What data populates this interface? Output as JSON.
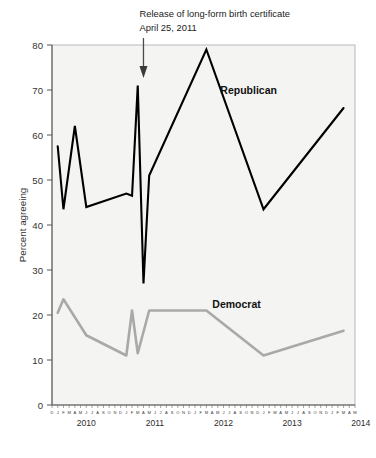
{
  "chart_data": {
    "type": "line",
    "title": "",
    "xlabel": "",
    "ylabel": "Percent agreeing",
    "ylim": [
      0,
      80
    ],
    "yticks": [
      0,
      10,
      20,
      30,
      40,
      50,
      60,
      70,
      80
    ],
    "grid": false,
    "legend_position": "inline-annotation",
    "xlim_months": [
      "2009-12",
      "2014-05"
    ],
    "month_tick_labels": [
      "J",
      "F",
      "M",
      "A",
      "M",
      "J",
      "J",
      "A",
      "S",
      "O",
      "N",
      "D"
    ],
    "year_tick_labels": [
      "2010",
      "2011",
      "2012",
      "2013",
      "2014"
    ],
    "annotations": [
      {
        "name": "release-annotation",
        "line1": "Release of long-form birth certificate",
        "line2": "April 25, 2011",
        "points_to_month": "2011-04",
        "arrow": true
      }
    ],
    "series": [
      {
        "name": "Republican",
        "color": "#000000",
        "label_x_month": "2012-03",
        "label_y_value": 70,
        "points": [
          {
            "month": "2010-01",
            "value": 57.5
          },
          {
            "month": "2010-02",
            "value": 43.5
          },
          {
            "month": "2010-04",
            "value": 62.0
          },
          {
            "month": "2010-06",
            "value": 44.0
          },
          {
            "month": "2011-01",
            "value": 47.0
          },
          {
            "month": "2011-02",
            "value": 46.5
          },
          {
            "month": "2011-03",
            "value": 71.0
          },
          {
            "month": "2011-04",
            "value": 27.0
          },
          {
            "month": "2011-05",
            "value": 51.0
          },
          {
            "month": "2012-03",
            "value": 79.0
          },
          {
            "month": "2013-01",
            "value": 43.5
          },
          {
            "month": "2014-03",
            "value": 66.0
          }
        ]
      },
      {
        "name": "Democrat",
        "color": "#a9a9a9",
        "label_x_month": "2012-03",
        "label_y_value": 22.5,
        "points": [
          {
            "month": "2010-01",
            "value": 20.5
          },
          {
            "month": "2010-02",
            "value": 23.5
          },
          {
            "month": "2010-06",
            "value": 15.5
          },
          {
            "month": "2011-01",
            "value": 11.0
          },
          {
            "month": "2011-02",
            "value": 21.0
          },
          {
            "month": "2011-03",
            "value": 11.5
          },
          {
            "month": "2011-05",
            "value": 21.0
          },
          {
            "month": "2012-03",
            "value": 21.0
          },
          {
            "month": "2013-01",
            "value": 11.0
          },
          {
            "month": "2014-03",
            "value": 16.5
          }
        ]
      }
    ]
  },
  "axes": {
    "y_axis_title": "Percent agreeing",
    "y_tick_0": "0",
    "y_tick_10": "10",
    "y_tick_20": "20",
    "y_tick_30": "30",
    "y_tick_40": "40",
    "y_tick_50": "50",
    "y_tick_60": "60",
    "y_tick_70": "70",
    "y_tick_80": "80"
  },
  "labels": {
    "republican": "Republican",
    "democrat": "Democrat",
    "annotation_line1": "Release of long-form birth certificate",
    "annotation_line2": "April 25, 2011",
    "year_2010": "2010",
    "year_2011": "2011",
    "year_2012": "2012",
    "year_2013": "2013",
    "year_2014": "2014"
  }
}
